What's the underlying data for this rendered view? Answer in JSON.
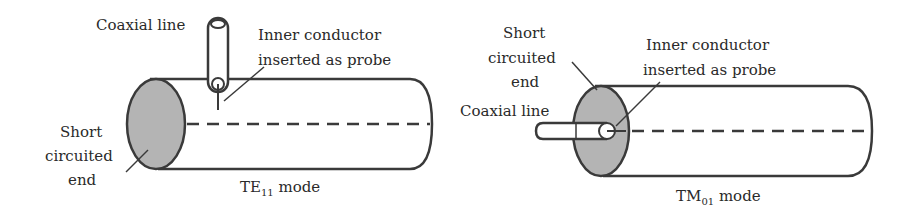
{
  "figures": [
    {
      "id": "te11",
      "labels": {
        "coaxial_line": "Coaxial line",
        "inner_conductor_line1": "Inner conductor",
        "inner_conductor_line2": "inserted as probe",
        "short_line1": "Short",
        "short_line2": "circuited",
        "short_line3": "end",
        "mode_main": "TE",
        "mode_sub": "11",
        "mode_suffix": " mode"
      }
    },
    {
      "id": "tm01",
      "labels": {
        "short_line1": "Short",
        "short_line2": "circuited",
        "short_line3": "end",
        "inner_conductor_line1": "Inner conductor",
        "inner_conductor_line2": "inserted as probe",
        "coaxial_line": "Coaxial line",
        "mode_main": "TM",
        "mode_sub": "01",
        "mode_suffix": " mode"
      }
    }
  ],
  "colors": {
    "stroke": "#3a3a3a",
    "end_fill": "#b4b4b4",
    "text": "#2a2a2a"
  }
}
